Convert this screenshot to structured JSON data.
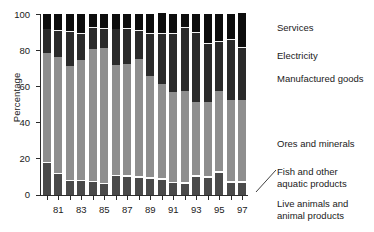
{
  "chart_data": {
    "type": "bar",
    "subtype": "stacked-percentage-column",
    "title": "",
    "xlabel": "",
    "ylabel": "Percentage",
    "ylim": [
      0,
      100
    ],
    "yticks": [
      0,
      20,
      40,
      60,
      80,
      100
    ],
    "grid": false,
    "legend_position": "right-outside",
    "categories": [
      "80",
      "81",
      "82",
      "83",
      "84",
      "85",
      "86",
      "87",
      "88",
      "89",
      "90",
      "91",
      "92",
      "93",
      "94",
      "95",
      "96",
      "97"
    ],
    "xtick_labels": [
      "81",
      "83",
      "85",
      "87",
      "89",
      "91",
      "93",
      "95",
      "97"
    ],
    "xtick_categories": [
      "81",
      "83",
      "85",
      "87",
      "89",
      "91",
      "93",
      "95",
      "97"
    ],
    "series": [
      {
        "name": "Live animals and animal products",
        "color": "#4a4a4a",
        "values": [
          17.5,
          11.5,
          7.5,
          7.5,
          7.0,
          6.0,
          10.5,
          10.0,
          9.5,
          9.0,
          8.5,
          6.5,
          6.0,
          10.0,
          9.5,
          12.0,
          6.5,
          6.5
        ]
      },
      {
        "name": "Fish and other aquatic products",
        "color": "#fdfdfd",
        "values": [
          0.8,
          0.8,
          0.8,
          0.8,
          0.8,
          0.8,
          0.8,
          0.8,
          0.8,
          0.8,
          0.8,
          0.8,
          1.0,
          1.2,
          1.2,
          1.2,
          1.3,
          1.5
        ]
      },
      {
        "name": "Ores and minerals",
        "color": "#8e8e8e",
        "values": [
          60.2,
          63.7,
          63.2,
          66.2,
          72.7,
          74.2,
          60.7,
          61.7,
          64.7,
          55.7,
          52.2,
          49.7,
          50.5,
          40.3,
          40.8,
          44.3,
          44.7,
          44.5
        ]
      },
      {
        "name": "Manufactured goods",
        "color": "#2a2a2a",
        "values": [
          13.0,
          14.5,
          18.5,
          14.5,
          12.0,
          11.0,
          19.5,
          19.5,
          15.5,
          23.5,
          27.5,
          32.0,
          35.0,
          38.0,
          32.0,
          27.0,
          33.0,
          29.0
        ]
      },
      {
        "name": "Electricity",
        "color": "#f2f2f2",
        "values": [
          0.5,
          0.5,
          0.5,
          0.5,
          0.5,
          0.5,
          0.5,
          0.5,
          0.5,
          0.5,
          0.5,
          0.5,
          0.5,
          0.5,
          0.5,
          0.5,
          0.5,
          0.5
        ]
      },
      {
        "name": "Services",
        "color": "#0d0d0d",
        "values": [
          8.0,
          9.0,
          9.5,
          10.5,
          7.0,
          7.5,
          8.0,
          7.5,
          9.0,
          10.5,
          11.0,
          10.5,
          7.0,
          10.0,
          16.0,
          15.0,
          14.0,
          18.5
        ]
      }
    ]
  },
  "axes": {
    "y_title": "Percentage",
    "y_ticks": [
      "100",
      "80",
      "60",
      "40",
      "20",
      "0"
    ],
    "x_ticks": [
      "81",
      "83",
      "85",
      "87",
      "89",
      "91",
      "93",
      "95",
      "97"
    ]
  },
  "legend": {
    "items": [
      {
        "label": "Services"
      },
      {
        "label": "Electricity"
      },
      {
        "label": "Manufactured goods"
      },
      {
        "label": "Ores and minerals"
      },
      {
        "label": "Fish and other\naquatic products"
      },
      {
        "label": "Live animals and\nanimal products"
      }
    ]
  }
}
